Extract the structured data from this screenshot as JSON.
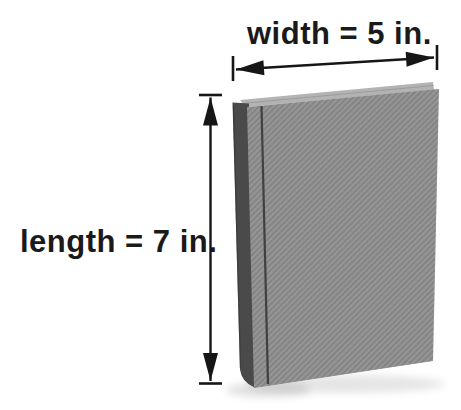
{
  "figure": {
    "labels": {
      "width": "width = 5 in.",
      "length": "length = 7 in."
    },
    "dimensions": [
      {
        "name": "width",
        "value": 5,
        "unit": "in.",
        "orientation": "horizontal"
      },
      {
        "name": "length",
        "value": 7,
        "unit": "in.",
        "orientation": "vertical"
      }
    ],
    "colors": {
      "background": "#ffffff",
      "text": "#1a1a1a",
      "arrow": "#161616",
      "cover": "#8d8d8d",
      "spine": "#4a4a4a",
      "pages": "#b3b3b3",
      "groove": "#383838"
    }
  }
}
